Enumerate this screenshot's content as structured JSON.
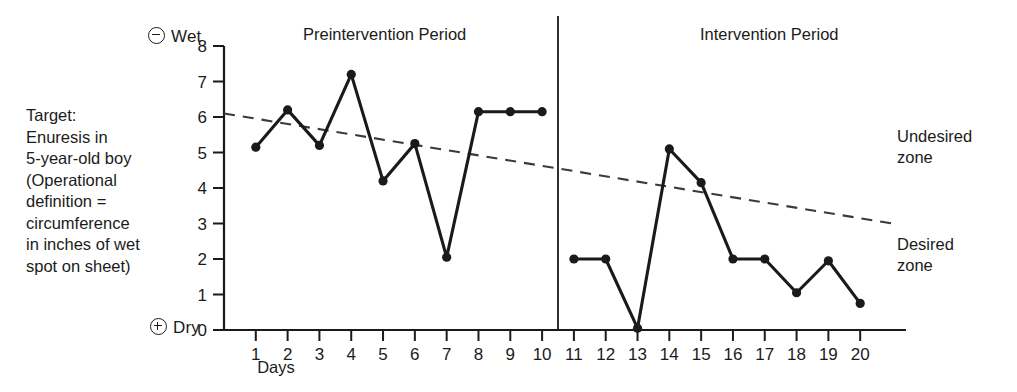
{
  "target_note": "Target:\nEnuresis in\n5-year-old boy\n(Operational\ndefinition =\ncircumference\nin inches of wet\nspot on sheet)",
  "axis_tips": {
    "top_sign": "minus-circle-icon",
    "top_label": "Wet",
    "bottom_sign": "plus-circle-icon",
    "bottom_label": "Dry"
  },
  "periods": {
    "pre_label": "Preintervention Period",
    "intervention_label": "Intervention Period"
  },
  "zones": {
    "undesired": "Undesired\nzone",
    "desired": "Desired\nzone"
  },
  "colors": {
    "line": "#1a1a1a",
    "trend": "#3a3a3a",
    "axis": "#1a1a1a",
    "background": "#ffffff"
  },
  "chart_data": {
    "type": "line",
    "title": "",
    "xlabel": "Days",
    "ylabel": "",
    "xlim": [
      0,
      21
    ],
    "ylim": [
      0,
      8
    ],
    "grid": false,
    "legend": "none",
    "x": [
      1,
      2,
      3,
      4,
      5,
      6,
      7,
      8,
      9,
      10,
      11,
      12,
      13,
      14,
      15,
      16,
      17,
      18,
      19,
      20
    ],
    "xticklabels": [
      "1",
      "2",
      "3",
      "4",
      "5",
      "6",
      "7",
      "8",
      "9",
      "10",
      "11",
      "12",
      "13",
      "14",
      "15",
      "16",
      "17",
      "18",
      "19",
      "20"
    ],
    "yticklabels": [
      "0",
      "1",
      "2",
      "3",
      "4",
      "5",
      "6",
      "7",
      "8"
    ],
    "yticks": [
      0,
      1,
      2,
      3,
      4,
      5,
      6,
      7,
      8
    ],
    "series": [
      {
        "name": "Wet spot circumference (inches)",
        "style": "solid-with-markers",
        "values": [
          5.15,
          6.2,
          5.2,
          7.2,
          4.2,
          5.25,
          2.05,
          6.15,
          6.15,
          6.15,
          2.0,
          2.0,
          0.05,
          5.1,
          4.15,
          2.0,
          2.0,
          1.05,
          1.95,
          0.75
        ]
      },
      {
        "name": "Celeration (trend) line",
        "style": "dashed",
        "x": [
          0,
          21
        ],
        "values": [
          6.1,
          3.0
        ]
      }
    ],
    "phase_change": {
      "at_x": 10.5,
      "label": "phase-change-line"
    },
    "annotations": [
      {
        "text": "Undesired zone",
        "position": "upper-right"
      },
      {
        "text": "Desired zone",
        "position": "lower-right"
      }
    ]
  }
}
